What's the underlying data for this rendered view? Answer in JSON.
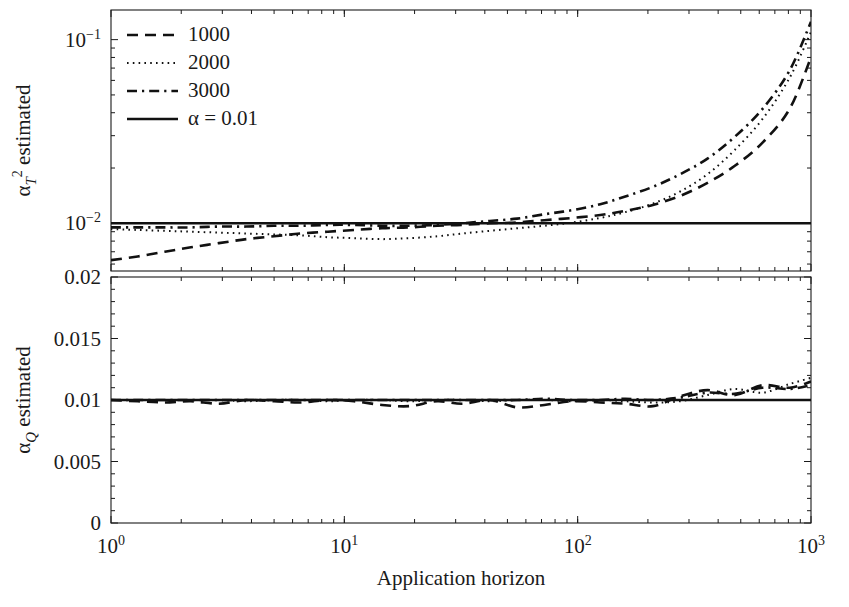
{
  "figure": {
    "background": "#ffffff",
    "ink_color": "#111111"
  },
  "legend": {
    "position": "top-left",
    "entries": [
      {
        "label": "1000",
        "style": "dashed",
        "name": "legend-item-1000"
      },
      {
        "label": "2000",
        "style": "dotted",
        "name": "legend-item-2000"
      },
      {
        "label": "3000",
        "style": "dash-dot",
        "name": "legend-item-3000"
      },
      {
        "label": "α = 0.01",
        "style": "solid",
        "name": "legend-item-alpha"
      }
    ]
  },
  "xaxis": {
    "label": "Application horizon",
    "scale": "log",
    "lim": [
      1,
      1000
    ],
    "tick_labels": [
      "10",
      "10",
      "10"
    ],
    "tick_exponents": [
      "0",
      "1",
      "2",
      "3"
    ],
    "ticks": [
      1,
      10,
      100,
      1000
    ],
    "tick_text": [
      "10⁰",
      "10¹",
      "10²",
      "10³"
    ]
  },
  "panels": [
    {
      "id": "top",
      "ylabel_parts": {
        "alpha": "α",
        "sub": "T",
        "sup": "2",
        "rest": " estimated"
      },
      "ylabel": "α_T² estimated",
      "yscale": "log",
      "ylim": [
        0.0055,
        0.145
      ],
      "ytick_text": [
        "10⁻¹",
        "10⁻²"
      ],
      "yticks": [
        0.1,
        0.01
      ]
    },
    {
      "id": "bottom",
      "ylabel_parts": {
        "alpha": "α",
        "sub": "Q",
        "sup": "",
        "rest": " estimated"
      },
      "ylabel": "α_Q estimated",
      "yscale": "linear",
      "ylim": [
        0,
        0.02
      ],
      "ytick_text": [
        "0.02",
        "0.015",
        "0.01",
        "0.005",
        "0"
      ],
      "yticks": [
        0.02,
        0.015,
        0.01,
        0.005,
        0
      ]
    }
  ],
  "chart_data": [
    {
      "type": "line",
      "panel": "top",
      "title": "",
      "xlabel": "Application horizon",
      "ylabel": "α_T² estimated",
      "xscale": "log",
      "yscale": "log",
      "xlim": [
        1,
        1000
      ],
      "ylim": [
        0.0055,
        0.145
      ],
      "grid": false,
      "legend_position": "upper left",
      "x": [
        1,
        1.3,
        1.7,
        2.2,
        2.9,
        3.8,
        5,
        6.5,
        8.5,
        11,
        14.5,
        19,
        25,
        32,
        42,
        55,
        72,
        95,
        125,
        160,
        210,
        275,
        360,
        470,
        620,
        810,
        1000
      ],
      "series": [
        {
          "name": "1000",
          "style": "dashed",
          "values": [
            0.0063,
            0.0066,
            0.007,
            0.0074,
            0.0078,
            0.0082,
            0.0085,
            0.0088,
            0.009,
            0.0092,
            0.0094,
            0.0095,
            0.0097,
            0.0098,
            0.01,
            0.0101,
            0.0104,
            0.0107,
            0.0111,
            0.0117,
            0.0126,
            0.0141,
            0.0166,
            0.0205,
            0.0275,
            0.042,
            0.08
          ]
        },
        {
          "name": "2000",
          "style": "dotted",
          "values": [
            0.0093,
            0.0092,
            0.0091,
            0.009,
            0.0089,
            0.0088,
            0.0087,
            0.0086,
            0.0084,
            0.0083,
            0.0082,
            0.0083,
            0.0085,
            0.0088,
            0.0091,
            0.0094,
            0.0097,
            0.0101,
            0.0107,
            0.0115,
            0.0128,
            0.0149,
            0.0185,
            0.025,
            0.037,
            0.062,
            0.11
          ]
        },
        {
          "name": "3000",
          "style": "dash-dot",
          "values": [
            0.0095,
            0.0095,
            0.0095,
            0.0095,
            0.0096,
            0.0096,
            0.0097,
            0.0097,
            0.0098,
            0.0098,
            0.0097,
            0.0097,
            0.0098,
            0.01,
            0.0103,
            0.0106,
            0.0112,
            0.0118,
            0.0127,
            0.014,
            0.0158,
            0.0185,
            0.0225,
            0.0295,
            0.042,
            0.068,
            0.125
          ]
        },
        {
          "name": "α = 0.01",
          "style": "solid",
          "values": [
            0.01,
            0.01,
            0.01,
            0.01,
            0.01,
            0.01,
            0.01,
            0.01,
            0.01,
            0.01,
            0.01,
            0.01,
            0.01,
            0.01,
            0.01,
            0.01,
            0.01,
            0.01,
            0.01,
            0.01,
            0.01,
            0.01,
            0.01,
            0.01,
            0.01,
            0.01,
            0.01
          ]
        }
      ]
    },
    {
      "type": "line",
      "panel": "bottom",
      "title": "",
      "xlabel": "Application horizon",
      "ylabel": "α_Q estimated",
      "xscale": "log",
      "yscale": "linear",
      "xlim": [
        1,
        1000
      ],
      "ylim": [
        0,
        0.02
      ],
      "grid": false,
      "legend_position": "none",
      "x": [
        1,
        1.3,
        1.7,
        2.2,
        2.9,
        3.8,
        5,
        6.5,
        8.5,
        11,
        14.5,
        19,
        25,
        32,
        42,
        55,
        72,
        95,
        125,
        160,
        210,
        275,
        360,
        470,
        620,
        810,
        1000
      ],
      "series": [
        {
          "name": "1000",
          "style": "dashed",
          "values": [
            0.01,
            0.0099,
            0.0098,
            0.0099,
            0.0097,
            0.01,
            0.0099,
            0.0098,
            0.01,
            0.0099,
            0.0096,
            0.0095,
            0.0099,
            0.0097,
            0.01,
            0.0094,
            0.0096,
            0.0099,
            0.0098,
            0.0097,
            0.0095,
            0.0103,
            0.0108,
            0.0104,
            0.0112,
            0.011,
            0.0115
          ]
        },
        {
          "name": "2000",
          "style": "dotted",
          "values": [
            0.01,
            0.01,
            0.01,
            0.01,
            0.01,
            0.0099,
            0.01,
            0.01,
            0.0099,
            0.01,
            0.01,
            0.0099,
            0.01,
            0.01,
            0.0099,
            0.01,
            0.01,
            0.0099,
            0.01,
            0.0099,
            0.0098,
            0.0099,
            0.0104,
            0.0109,
            0.0106,
            0.0113,
            0.0118
          ]
        },
        {
          "name": "3000",
          "style": "dash-dot",
          "values": [
            0.01,
            0.01,
            0.01,
            0.01,
            0.01,
            0.01,
            0.01,
            0.01,
            0.01,
            0.01,
            0.01,
            0.01,
            0.01,
            0.01,
            0.01,
            0.01,
            0.0101,
            0.01,
            0.01,
            0.0101,
            0.01,
            0.0102,
            0.0106,
            0.0105,
            0.011,
            0.0109,
            0.0112
          ]
        },
        {
          "name": "α = 0.01",
          "style": "solid",
          "values": [
            0.01,
            0.01,
            0.01,
            0.01,
            0.01,
            0.01,
            0.01,
            0.01,
            0.01,
            0.01,
            0.01,
            0.01,
            0.01,
            0.01,
            0.01,
            0.01,
            0.01,
            0.01,
            0.01,
            0.01,
            0.01,
            0.01,
            0.01,
            0.01,
            0.01,
            0.01,
            0.01
          ]
        }
      ]
    }
  ]
}
